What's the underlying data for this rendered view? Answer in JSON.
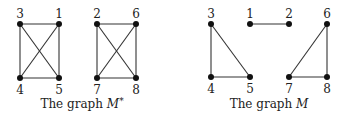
{
  "graphs": [
    {
      "id": "m-star",
      "caption_prefix": "The graph ",
      "caption_symbol": "M",
      "caption_sup": "*",
      "caption_x": 82,
      "nodes": [
        {
          "id": "3",
          "x": 20,
          "y": 24,
          "label_pos": "above"
        },
        {
          "id": "1",
          "x": 59,
          "y": 24,
          "label_pos": "above"
        },
        {
          "id": "4",
          "x": 20,
          "y": 78,
          "label_pos": "below"
        },
        {
          "id": "5",
          "x": 59,
          "y": 78,
          "label_pos": "below"
        },
        {
          "id": "2",
          "x": 97,
          "y": 24,
          "label_pos": "above"
        },
        {
          "id": "6",
          "x": 136,
          "y": 24,
          "label_pos": "above"
        },
        {
          "id": "7",
          "x": 97,
          "y": 78,
          "label_pos": "below"
        },
        {
          "id": "8",
          "x": 136,
          "y": 78,
          "label_pos": "below"
        }
      ],
      "edges": [
        [
          "3",
          "1"
        ],
        [
          "3",
          "4"
        ],
        [
          "1",
          "5"
        ],
        [
          "4",
          "5"
        ],
        [
          "3",
          "5"
        ],
        [
          "1",
          "4"
        ],
        [
          "2",
          "6"
        ],
        [
          "2",
          "7"
        ],
        [
          "6",
          "8"
        ],
        [
          "7",
          "8"
        ],
        [
          "2",
          "8"
        ],
        [
          "6",
          "7"
        ]
      ]
    },
    {
      "id": "m",
      "caption_prefix": "The graph ",
      "caption_symbol": "M",
      "caption_sup": "",
      "caption_x": 269,
      "nodes": [
        {
          "id": "3",
          "x": 211,
          "y": 24,
          "label_pos": "above"
        },
        {
          "id": "1",
          "x": 250,
          "y": 24,
          "label_pos": "above"
        },
        {
          "id": "2",
          "x": 289,
          "y": 24,
          "label_pos": "above"
        },
        {
          "id": "6",
          "x": 327,
          "y": 24,
          "label_pos": "above"
        },
        {
          "id": "4",
          "x": 211,
          "y": 77,
          "label_pos": "below"
        },
        {
          "id": "5",
          "x": 250,
          "y": 77,
          "label_pos": "below"
        },
        {
          "id": "7",
          "x": 289,
          "y": 77,
          "label_pos": "below"
        },
        {
          "id": "8",
          "x": 327,
          "y": 77,
          "label_pos": "below"
        }
      ],
      "edges": [
        [
          "3",
          "4"
        ],
        [
          "3",
          "5"
        ],
        [
          "4",
          "5"
        ],
        [
          "1",
          "2"
        ],
        [
          "6",
          "7"
        ],
        [
          "6",
          "8"
        ],
        [
          "7",
          "8"
        ]
      ]
    }
  ],
  "style": {
    "edge_color": "#333333",
    "node_color": "#111111",
    "node_radius": 3
  }
}
